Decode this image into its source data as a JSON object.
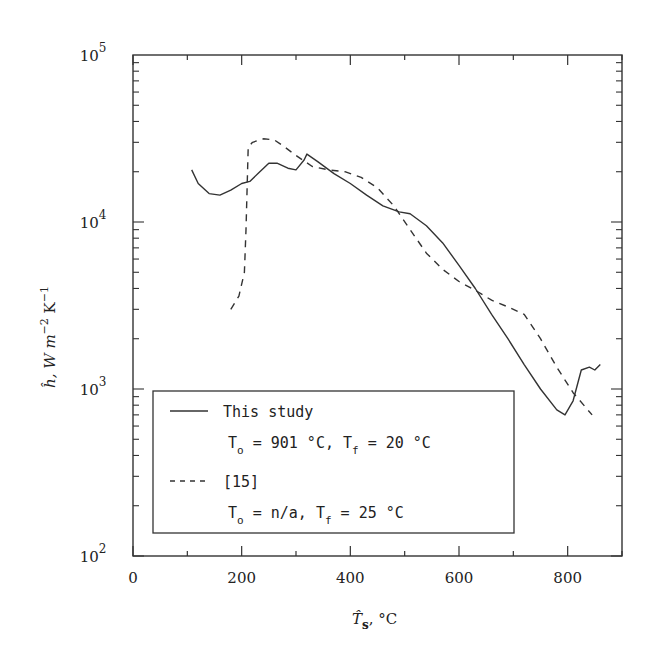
{
  "chart_data": {
    "type": "line",
    "title": "",
    "xlabel": "T̂s, °C",
    "ylabel": "ĥ, W m^-2 K^-1",
    "xlim": [
      0,
      900
    ],
    "ylim": [
      100,
      100000
    ],
    "yscale": "log",
    "x_ticks": [
      0,
      200,
      400,
      600,
      800
    ],
    "x_tick_labels": [
      "0",
      "200",
      "400",
      "600",
      "800"
    ],
    "y_ticks": [
      100,
      1000,
      10000,
      100000
    ],
    "y_tick_labels": [
      {
        "base": "10",
        "exp": "2"
      },
      {
        "base": "10",
        "exp": "3"
      },
      {
        "base": "10",
        "exp": "4"
      },
      {
        "base": "10",
        "exp": "5"
      }
    ],
    "grid": false,
    "legend_position": "lower left",
    "series": [
      {
        "name": "This study",
        "condition": "To = 901 °C, Tf = 20 °C",
        "style": "solid",
        "x": [
          108,
          120,
          140,
          160,
          180,
          200,
          215,
          230,
          250,
          265,
          285,
          300,
          315,
          320,
          340,
          370,
          400,
          430,
          460,
          490,
          510,
          540,
          570,
          600,
          630,
          660,
          690,
          720,
          750,
          780,
          795,
          810,
          825,
          840,
          850,
          860
        ],
        "y": [
          20500,
          17000,
          14800,
          14500,
          15500,
          17000,
          17500,
          19500,
          22500,
          22500,
          21000,
          20500,
          23500,
          25500,
          23000,
          19500,
          17000,
          14500,
          12500,
          11500,
          11200,
          9500,
          7500,
          5500,
          4000,
          2800,
          2000,
          1400,
          1000,
          750,
          700,
          850,
          1300,
          1350,
          1300,
          1400
        ]
      },
      {
        "name": "[15]",
        "condition": "To = n/a, Tf = 25 °C",
        "style": "dashed",
        "x": [
          180,
          195,
          205,
          208,
          212,
          220,
          240,
          260,
          280,
          300,
          330,
          360,
          390,
          420,
          450,
          480,
          510,
          540,
          570,
          600,
          630,
          660,
          690,
          720,
          750,
          780,
          810,
          845
        ],
        "y": [
          3000,
          3600,
          5000,
          9000,
          28000,
          30000,
          31500,
          31000,
          28000,
          25000,
          21500,
          20500,
          20000,
          18500,
          16000,
          12500,
          9000,
          6500,
          5200,
          4400,
          3900,
          3400,
          3100,
          2800,
          2000,
          1350,
          950,
          700
        ]
      }
    ]
  },
  "legend": {
    "entries": [
      {
        "label": "This study",
        "line2_prefix": "T",
        "line2_sub1": "o",
        "line2_mid": " = 901 °C,  T",
        "line2_sub2": "f",
        "line2_end": " = 20 °C"
      },
      {
        "label": "[15]",
        "line2_prefix": "T",
        "line2_sub1": "o",
        "line2_mid": " = n/a,  T",
        "line2_sub2": "f",
        "line2_end": " = 25 °C"
      }
    ]
  },
  "axes": {
    "x_label_main": "T̂",
    "x_label_sub": "s",
    "x_label_unit": ",   °C",
    "y_label_main": "ĥ, W m",
    "y_label_exp1": "−2",
    "y_label_mid": " K",
    "y_label_exp2": "−1"
  }
}
